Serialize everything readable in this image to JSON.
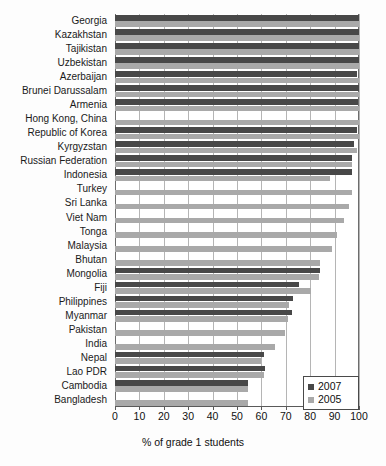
{
  "chart_data": {
    "type": "bar",
    "orientation": "horizontal",
    "title": "",
    "xlabel": "% of grade 1 students",
    "ylabel": "",
    "xlim": [
      0,
      100
    ],
    "xticks": [
      0,
      10,
      20,
      30,
      40,
      50,
      60,
      70,
      80,
      90,
      100
    ],
    "grid": "vertical",
    "legend_position": "bottom-right",
    "categories": [
      "Georgia",
      "Kazakhstan",
      "Tajikistan",
      "Uzbekistan",
      "Azerbaijan",
      "Brunei Darussalam",
      "Armenia",
      "Hong Kong, China",
      "Republic of Korea",
      "Kyrgyzstan",
      "Russian Federation",
      "Indonesia",
      "Turkey",
      "Sri Lanka",
      "Viet Nam",
      "Tonga",
      "Malaysia",
      "Bhutan",
      "Mongolia",
      "Fiji",
      "Philippines",
      "Myanmar",
      "Pakistan",
      "India",
      "Nepal",
      "Lao PDR",
      "Cambodia",
      "Bangladesh"
    ],
    "series": [
      {
        "name": "2007",
        "color": "#484848",
        "values": [
          100,
          100,
          100,
          100,
          99,
          100,
          99.5,
          null,
          99,
          98,
          97,
          97,
          null,
          null,
          null,
          null,
          null,
          null,
          84,
          75.5,
          73,
          72.5,
          null,
          null,
          61,
          61.5,
          54.5,
          null
        ]
      },
      {
        "name": "2005",
        "color": "#a9a9a9",
        "values": [
          100,
          100,
          100,
          100,
          100,
          100,
          100,
          100,
          100,
          99,
          97,
          88,
          97,
          96,
          94,
          91,
          89,
          84,
          83.5,
          80.5,
          71.5,
          71,
          69.5,
          65.5,
          60,
          61,
          54.5,
          54.5
        ]
      }
    ]
  },
  "legend": {
    "entries": [
      {
        "label": "2007"
      },
      {
        "label": "2005"
      }
    ]
  },
  "axis": {
    "x_title": "% of grade 1 students",
    "tick_labels": [
      "0",
      "10",
      "20",
      "30",
      "40",
      "50",
      "60",
      "70",
      "80",
      "90",
      "100"
    ]
  }
}
